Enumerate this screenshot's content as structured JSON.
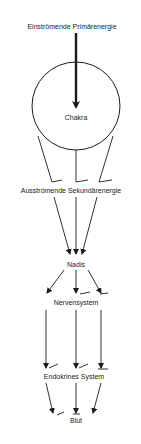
{
  "diagram": {
    "colors": {
      "background": "#ffffff",
      "stroke": "#1a1a1a",
      "text": "#222222"
    },
    "nodes": [
      {
        "id": "primary",
        "label": "Einströmende Primärenergie",
        "x": 72,
        "y": 23
      },
      {
        "id": "chakra",
        "label": "Chakra",
        "x": 76,
        "y": 114,
        "shape": "circle",
        "cx": 76,
        "cy": 106,
        "r": 44
      },
      {
        "id": "secondary",
        "label": "Ausströmende Sekundärenergie",
        "x": 71,
        "y": 187
      },
      {
        "id": "nadis",
        "label": "Nadis",
        "x": 76,
        "y": 261
      },
      {
        "id": "nervous",
        "label": "Nervensystem",
        "x": 76,
        "y": 299
      },
      {
        "id": "endocrine",
        "label": "Endokrines System",
        "x": 74,
        "y": 373
      },
      {
        "id": "blood",
        "label": "Blut",
        "x": 76,
        "y": 417
      }
    ],
    "edges": [
      {
        "from": "primary",
        "to": "chakra",
        "style": "thick-arrow"
      },
      {
        "from": "chakra",
        "to": "secondary",
        "count": 3,
        "style": "line"
      },
      {
        "from": "secondary",
        "to": "nadis",
        "count": 3,
        "style": "arrow"
      },
      {
        "from": "nadis",
        "to": "nervous",
        "count": 3,
        "style": "arrow"
      },
      {
        "from": "nervous",
        "to": "endocrine",
        "count": 3,
        "style": "arrow"
      },
      {
        "from": "endocrine",
        "to": "blood",
        "count": 3,
        "style": "arrow"
      }
    ]
  }
}
